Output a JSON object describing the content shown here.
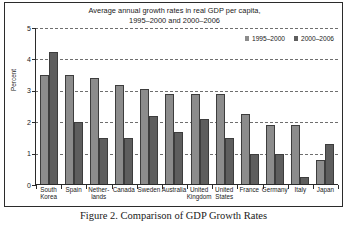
{
  "figure": {
    "caption": "Figure 2. Comparison of GDP Growth Rates"
  },
  "chart_data": {
    "type": "bar",
    "title": "Average annual growth rates in real GDP per capita, 1995–2000 and 2000–2006",
    "title_line1": "Average annual growth rates in real GDP per capita,",
    "title_line2": "1995–2000 and 2000–2006",
    "xlabel": "",
    "ylabel": "Percent",
    "ylim": [
      0,
      5
    ],
    "yticks": [
      0,
      1,
      2,
      3,
      4,
      5
    ],
    "ytick_labels": [
      "0",
      "1",
      "2",
      "3",
      "4",
      "5"
    ],
    "grid": true,
    "grid_axis": "y",
    "legend_position": "top-right",
    "categories": [
      "South Korea",
      "Spain",
      "Netherlands",
      "Canada",
      "Sweden",
      "Australia",
      "United Kingdom",
      "United States",
      "France",
      "Germany",
      "Italy",
      "Japan"
    ],
    "category_lines": [
      [
        "South",
        "Korea"
      ],
      [
        "Spain"
      ],
      [
        "Nether-",
        "lands"
      ],
      [
        "Canada"
      ],
      [
        "Sweden"
      ],
      [
        "Australia"
      ],
      [
        "United",
        "Kingdom"
      ],
      [
        "United",
        "States"
      ],
      [
        "France"
      ],
      [
        "Germany"
      ],
      [
        "Italy"
      ],
      [
        "Japan"
      ]
    ],
    "series": [
      {
        "name": "1995–2000",
        "color": "#8c8c8c",
        "values": [
          3.5,
          3.5,
          3.4,
          3.2,
          3.05,
          2.9,
          2.9,
          2.9,
          2.25,
          1.9,
          1.9,
          0.8
        ]
      },
      {
        "name": "2000–2006",
        "color": "#5e5e5e",
        "values": [
          4.25,
          2.0,
          1.5,
          1.5,
          2.2,
          1.7,
          2.1,
          1.5,
          1.0,
          1.0,
          0.25,
          1.3
        ]
      }
    ]
  }
}
